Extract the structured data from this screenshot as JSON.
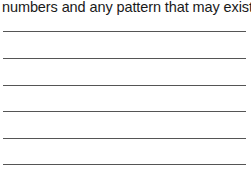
{
  "prompt": {
    "text": "numbers and any pattern that may exist:"
  },
  "answer_lines": [
    {
      "y": 31
    },
    {
      "y": 58
    },
    {
      "y": 85
    },
    {
      "y": 111
    },
    {
      "y": 138
    },
    {
      "y": 164
    }
  ]
}
